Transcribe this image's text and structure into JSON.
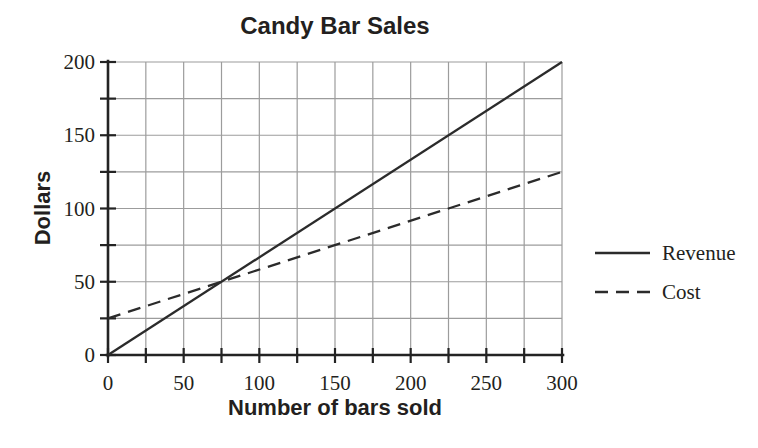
{
  "chart_data": {
    "type": "line",
    "title": "Candy Bar Sales",
    "xlabel": "Number of bars sold",
    "ylabel": "Dollars",
    "xlim": [
      0,
      300
    ],
    "ylim": [
      0,
      200
    ],
    "x_major_ticks": [
      0,
      50,
      100,
      150,
      200,
      250,
      300
    ],
    "y_major_ticks": [
      0,
      50,
      100,
      150,
      200
    ],
    "minor_tick_step": 25,
    "grid": true,
    "grid_step": 25,
    "legend_position": "right-of-plot",
    "series": [
      {
        "name": "Revenue",
        "line_style": "solid",
        "points": [
          [
            0,
            0
          ],
          [
            300,
            200
          ]
        ]
      },
      {
        "name": "Cost",
        "line_style": "dashed",
        "points": [
          [
            0,
            25
          ],
          [
            300,
            125
          ]
        ]
      }
    ],
    "colors": {
      "series_line": "#2b2b2b",
      "grid_line": "#9c9c9c",
      "axis_line": "#232323",
      "text": "#231f20",
      "background": "#ffffff"
    }
  }
}
